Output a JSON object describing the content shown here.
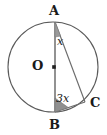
{
  "figure": {
    "stroke_color": "#555555",
    "fill_color": "#9a9a9a",
    "background": "#ffffff",
    "labels": {
      "point_a": "A",
      "point_b": "B",
      "point_c": "C",
      "center_o": "O",
      "angle_at_a": "x",
      "angle_at_b": "3x"
    },
    "geometry": {
      "circle": {
        "cx": 53,
        "cy": 67,
        "r": 45
      },
      "points": {
        "A": {
          "x": 55,
          "y": 22
        },
        "B": {
          "x": 55,
          "y": 112
        },
        "C": {
          "x": 85,
          "y": 102
        },
        "O": {
          "x": 53,
          "y": 67
        }
      },
      "segments": [
        {
          "name": "diameter-AB",
          "from": "A",
          "to": "B"
        },
        {
          "name": "chord-AC",
          "from": "A",
          "to": "C"
        },
        {
          "name": "chord-BC",
          "from": "B",
          "to": "C"
        }
      ],
      "angle_marks": [
        {
          "name": "angle-mark-a",
          "vertex": "A",
          "label": "x"
        },
        {
          "name": "angle-mark-b",
          "vertex": "B",
          "label": "3x"
        }
      ]
    }
  }
}
